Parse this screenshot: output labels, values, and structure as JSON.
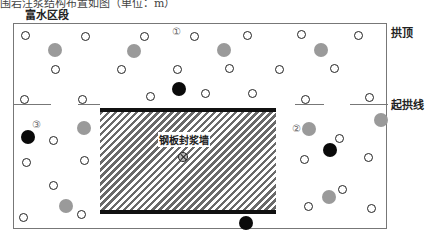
{
  "caption_fragment": "围岩注浆结构布置如图（单位：m）",
  "section_title": "富水区段",
  "labels": {
    "crown": "拱顶",
    "springline": "起拱线",
    "wall": "钢板封浆墙"
  },
  "markers": [
    "①",
    "②",
    "③"
  ],
  "legend_semantics": {
    "open_circle": "grouting hole",
    "grey_circle": "grey filled hole",
    "black_circle": "black filled hole",
    "hatched_rect": "steel plate grout-sealing wall"
  },
  "colors": {
    "frame": "#777777",
    "hatch": "#6a6a6a",
    "wall_border": "#111111",
    "grey_hole": "#9a9a9a",
    "black_hole": "#0a0a0a"
  }
}
